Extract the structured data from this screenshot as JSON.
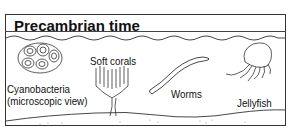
{
  "panel": {
    "title": "Precambrian time",
    "organisms": [
      {
        "name": "cyanobacteria",
        "label_line1": "Cyanobacteria",
        "label_line2": "(microscopic view)"
      },
      {
        "name": "soft-corals",
        "label": "Soft corals"
      },
      {
        "name": "worms",
        "label": "Worms"
      },
      {
        "name": "jellyfish",
        "label": "Jellyfish"
      }
    ]
  }
}
